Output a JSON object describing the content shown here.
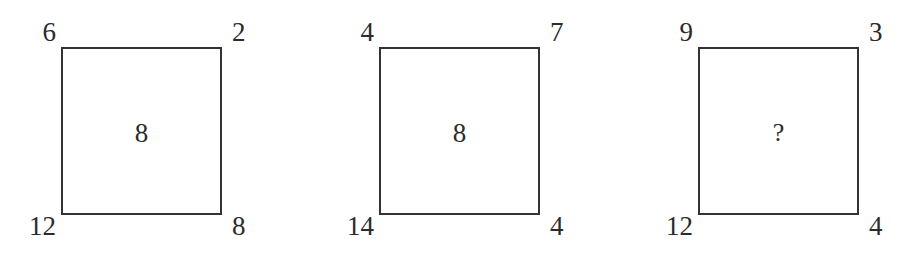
{
  "figure": {
    "type": "number-puzzle",
    "background_color": "#ffffff",
    "stroke_color": "#333333",
    "text_color": "#2b2b2b",
    "unknown_symbol": "?"
  },
  "squares": [
    {
      "index": 1,
      "top_left": "6",
      "top_right": "2",
      "bottom_left": "12",
      "bottom_right": "8",
      "center": "8"
    },
    {
      "index": 2,
      "top_left": "4",
      "top_right": "7",
      "bottom_left": "14",
      "bottom_right": "4",
      "center": "8"
    },
    {
      "index": 3,
      "top_left": "9",
      "top_right": "3",
      "bottom_left": "12",
      "bottom_right": "4",
      "center": "?"
    }
  ]
}
